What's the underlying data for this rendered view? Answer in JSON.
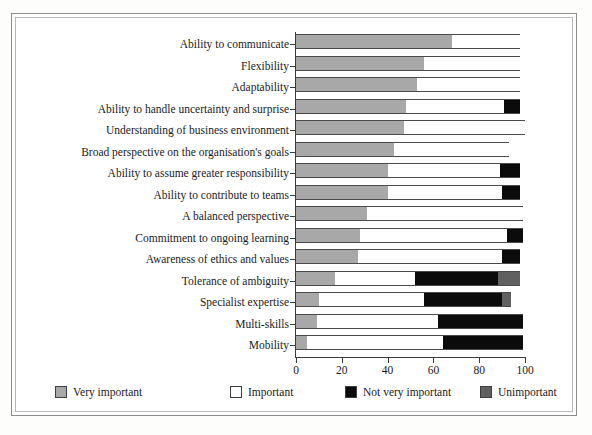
{
  "chart_data": {
    "type": "bar",
    "orientation": "horizontal",
    "stacked": true,
    "title": "",
    "subtitle": "",
    "xlabel": "",
    "ylabel": "",
    "xlim": [
      0,
      100
    ],
    "xticks": [
      0,
      20,
      40,
      60,
      80,
      100
    ],
    "xtick_labels": [
      "0",
      "20",
      "40",
      "60",
      "80",
      "100"
    ],
    "grid": false,
    "legend_position": "bottom",
    "categories": [
      "Ability to communicate",
      "Flexibility",
      "Adaptability",
      "Ability to handle uncertainty and surprise",
      "Understanding of business environment",
      "Broad perspective on the organisation's goals",
      "Ability to assume greater responsibility",
      "Ability to contribute to teams",
      "A balanced perspective",
      "Commitment to ongoing learning",
      "Awareness of ethics and values",
      "Tolerance of ambiguity",
      "Specialist expertise",
      "Multi-skills",
      "Mobility"
    ],
    "series": [
      {
        "name": "Very important",
        "color": "#a8a8a8",
        "values": [
          68,
          56,
          53,
          48,
          47,
          43,
          40,
          40,
          31,
          28,
          27,
          17,
          10,
          9,
          5
        ]
      },
      {
        "name": "Important",
        "color": "#ffffff",
        "values": [
          30,
          42,
          45,
          43,
          53,
          50,
          49,
          50,
          68,
          64,
          63,
          35,
          46,
          53,
          59
        ]
      },
      {
        "name": "Not very important",
        "color": "#0b0b0b",
        "values": [
          0,
          0,
          0,
          7,
          0,
          0,
          9,
          8,
          0,
          7,
          8,
          36,
          34,
          37,
          35
        ]
      },
      {
        "name": "Unimportant",
        "color": "#606060",
        "values": [
          0,
          0,
          0,
          0,
          0,
          0,
          0,
          0,
          0,
          0,
          0,
          10,
          4,
          0,
          0
        ]
      }
    ],
    "bar_totals": [
      98,
      98,
      98,
      98,
      100,
      93,
      98,
      98,
      99,
      99,
      98,
      98,
      94,
      99,
      99
    ]
  },
  "legend": {
    "items": [
      {
        "label": "Very important",
        "color": "#a8a8a8"
      },
      {
        "label": "Important",
        "color": "#ffffff"
      },
      {
        "label": "Not very important",
        "color": "#0b0b0b"
      },
      {
        "label": "Unimportant",
        "color": "#606060"
      }
    ]
  }
}
